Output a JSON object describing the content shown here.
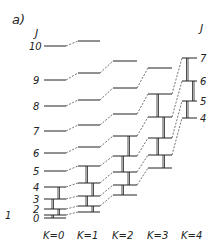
{
  "figure": {
    "panel_label": "a)",
    "axis_label_left": "J",
    "axis_label_right": "J",
    "k_labels": [
      "K=0",
      "K=1",
      "K=2",
      "K=3",
      "K=4"
    ],
    "left_j_labels": [
      "10",
      "9",
      "8",
      "7",
      "6",
      "5",
      "4",
      "3",
      "2",
      "1",
      "0"
    ],
    "right_j_labels": [
      "7",
      "6",
      "5",
      "4"
    ]
  },
  "levels": {
    "K0": {
      "x1": 44,
      "x2": 66,
      "J": {
        "0": 218,
        "1": 215,
        "2": 209,
        "3": 199,
        "4": 187,
        "5": 171,
        "6": 153,
        "7": 131,
        "8": 106,
        "9": 80,
        "10": 46
      }
    },
    "K1": {
      "x1": 78,
      "x2": 100,
      "J": {
        "1": 212,
        "2": 206,
        "3": 196,
        "4": 183,
        "5": 166,
        "6": 147,
        "7": 125,
        "8": 100,
        "9": 73,
        "10": 41
      }
    },
    "K2": {
      "x1": 113,
      "x2": 137,
      "J": {
        "2": 195,
        "3": 185,
        "4": 172,
        "5": 156,
        "6": 136,
        "7": 114,
        "8": 88,
        "9": 61
      }
    },
    "K3": {
      "x1": 148,
      "x2": 172,
      "J": {
        "3": 168,
        "4": 155,
        "5": 138,
        "6": 117,
        "7": 94,
        "8": 68
      }
    },
    "K4": {
      "x1": 182,
      "x2": 197,
      "J": {
        "4": 118,
        "5": 101,
        "6": 81,
        "7": 58
      }
    }
  },
  "colors": {
    "line": "#222222",
    "background": "#ffffff"
  }
}
